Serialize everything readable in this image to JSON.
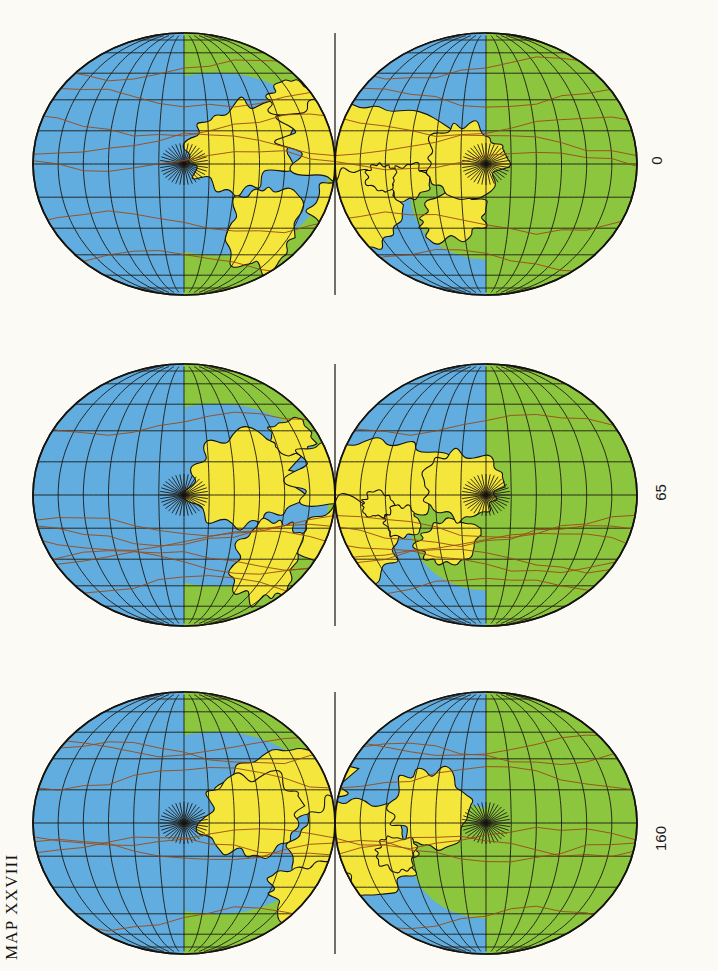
{
  "plate": {
    "label": "MAP XXVIII",
    "background_color": "#fbfaf5"
  },
  "palette": {
    "ocean_shallow": "#62ade0",
    "ocean_deep": "#62ade0",
    "continent": "#f5e63c",
    "land_green": "#8cc63f",
    "graticule": "#1d1a14",
    "outline": "#16130e",
    "ridge": "#9a4a16",
    "text": "#16140f"
  },
  "projection": {
    "name": "interrupted-double-lobe",
    "lobes": 2,
    "graticule_spacing_deg": 15,
    "poles_shown": 2
  },
  "maps": [
    {
      "id": "map-0ma",
      "age_label": "0",
      "age_ma": 0,
      "order": 1,
      "center_x": 335,
      "center_y": 164,
      "half_width": 302,
      "half_height": 131,
      "label_x": 660,
      "label_y": 160,
      "seed": 11,
      "land": [
        {
          "name": "north-america",
          "cx": -95,
          "cy": -18,
          "rx": 58,
          "ry": 44,
          "rot": -18
        },
        {
          "name": "greenland",
          "cx": -40,
          "cy": -62,
          "rx": 26,
          "ry": 20,
          "rot": 10
        },
        {
          "name": "eurasia",
          "cx": 30,
          "cy": -20,
          "rx": 90,
          "ry": 42,
          "rot": 6
        },
        {
          "name": "africa",
          "cx": 18,
          "cy": 48,
          "rx": 46,
          "ry": 40,
          "rot": -8
        },
        {
          "name": "south-america",
          "cx": -72,
          "cy": 62,
          "rx": 34,
          "ry": 46,
          "rot": 20
        },
        {
          "name": "australia",
          "cx": 118,
          "cy": 52,
          "rx": 34,
          "ry": 24,
          "rot": -12
        },
        {
          "name": "antarctica-lobe",
          "cx": 130,
          "cy": -6,
          "rx": 40,
          "ry": 36,
          "rot": 0
        },
        {
          "name": "india",
          "cx": 74,
          "cy": 18,
          "rx": 20,
          "ry": 18,
          "rot": 0
        },
        {
          "name": "arabia",
          "cx": 46,
          "cy": 14,
          "rx": 16,
          "ry": 14,
          "rot": 0
        }
      ]
    },
    {
      "id": "map-65ma",
      "age_label": "65",
      "age_ma": 65,
      "order": 2,
      "center_x": 335,
      "center_y": 495,
      "half_width": 302,
      "half_height": 131,
      "label_x": 660,
      "label_y": 492,
      "seed": 37,
      "land": [
        {
          "name": "north-america",
          "cx": -88,
          "cy": -16,
          "rx": 56,
          "ry": 46,
          "rot": -12
        },
        {
          "name": "greenland",
          "cx": -44,
          "cy": -58,
          "rx": 24,
          "ry": 18,
          "rot": 14
        },
        {
          "name": "eurasia",
          "cx": 34,
          "cy": -18,
          "rx": 86,
          "ry": 40,
          "rot": 4
        },
        {
          "name": "africa",
          "cx": 14,
          "cy": 46,
          "rx": 48,
          "ry": 42,
          "rot": -6
        },
        {
          "name": "south-america",
          "cx": -68,
          "cy": 66,
          "rx": 32,
          "ry": 44,
          "rot": 22
        },
        {
          "name": "australia",
          "cx": 114,
          "cy": 48,
          "rx": 32,
          "ry": 22,
          "rot": -14
        },
        {
          "name": "antarctica-lobe",
          "cx": 126,
          "cy": -8,
          "rx": 38,
          "ry": 34,
          "rot": 0
        },
        {
          "name": "india",
          "cx": 66,
          "cy": 28,
          "rx": 18,
          "ry": 16,
          "rot": 0
        },
        {
          "name": "arabia",
          "cx": 42,
          "cy": 10,
          "rx": 15,
          "ry": 13,
          "rot": 0
        }
      ]
    },
    {
      "id": "map-160ma",
      "age_label": "160",
      "age_ma": 160,
      "order": 3,
      "center_x": 335,
      "center_y": 823,
      "half_width": 302,
      "half_height": 131,
      "label_x": 660,
      "label_y": 838,
      "seed": 73,
      "land": [
        {
          "name": "laurasia",
          "cx": -58,
          "cy": -34,
          "rx": 74,
          "ry": 40,
          "rot": -14
        },
        {
          "name": "north-america",
          "cx": -82,
          "cy": -8,
          "rx": 50,
          "ry": 40,
          "rot": -10
        },
        {
          "name": "pangaea-core",
          "cx": 16,
          "cy": 26,
          "rx": 68,
          "ry": 52,
          "rot": -4
        },
        {
          "name": "gondwana-east",
          "cx": 96,
          "cy": -14,
          "rx": 42,
          "ry": 38,
          "rot": 8
        },
        {
          "name": "south-block",
          "cx": -22,
          "cy": 74,
          "rx": 44,
          "ry": 34,
          "rot": 12
        },
        {
          "name": "india-block",
          "cx": 62,
          "cy": 30,
          "rx": 20,
          "ry": 18,
          "rot": 0
        }
      ]
    }
  ]
}
